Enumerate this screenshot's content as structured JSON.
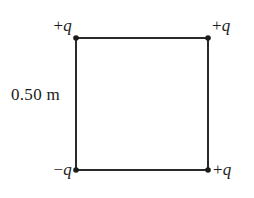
{
  "figure": {
    "background_color": "#ffffff",
    "line_color": "#2a2a2a",
    "text_color": "#1c1c1c"
  },
  "shape": {
    "name": "square",
    "side_length_label": "0.50 m",
    "stroke_width_px": 2,
    "corners": {
      "top_left": {
        "x": 76,
        "y": 38
      },
      "top_right": {
        "x": 208,
        "y": 38
      },
      "bottom_left": {
        "x": 76,
        "y": 170
      },
      "bottom_right": {
        "x": 208,
        "y": 170
      }
    }
  },
  "charges": {
    "top_left": {
      "sign": "+",
      "symbol": "q",
      "text": "+q"
    },
    "top_right": {
      "sign": "+",
      "symbol": "q",
      "text": "+q"
    },
    "bottom_left": {
      "sign": "−",
      "symbol": "q",
      "text": "−q"
    },
    "bottom_right": {
      "sign": "+",
      "symbol": "q",
      "text": "+q"
    }
  },
  "dimension": {
    "label": "0.50 m",
    "value": 0.5,
    "unit": "m",
    "applies_to": "left-side"
  },
  "markers": {
    "name": "charge-point-marker",
    "shape": "filled-dot",
    "size_px": 5,
    "color": "#1c1c1c"
  }
}
